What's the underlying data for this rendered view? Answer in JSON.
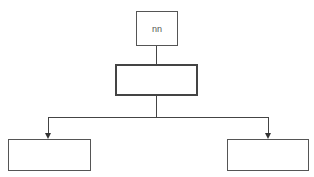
{
  "corner_text": "Label",
  "diagram": {
    "top_box": {
      "label": "nn"
    },
    "middle_box": {
      "label": ""
    },
    "left_box": {
      "label": ""
    },
    "right_box": {
      "label": ""
    }
  }
}
